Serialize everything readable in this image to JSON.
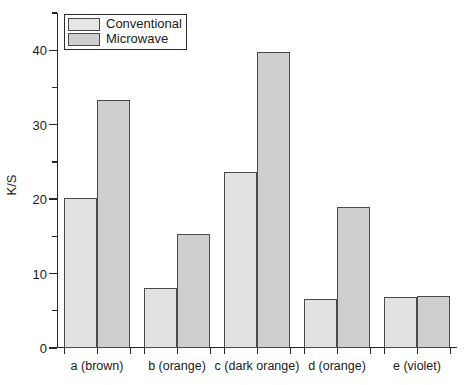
{
  "chart_data": {
    "type": "bar",
    "title": "",
    "xlabel": "",
    "ylabel": "K/S",
    "categories": [
      "a (brown)",
      "b (orange)",
      "c (dark orange)",
      "d (orange)",
      "e (violet)"
    ],
    "series": [
      {
        "name": "Conventional",
        "values": [
          20.1,
          8.1,
          23.6,
          6.6,
          6.9
        ],
        "color": "#e2e2e2"
      },
      {
        "name": "Microwave",
        "values": [
          33.3,
          15.3,
          39.7,
          18.9,
          7.0
        ],
        "color": "#cfcfcf"
      }
    ],
    "ylim": [
      0,
      45
    ],
    "y_major_ticks": [
      0,
      10,
      20,
      30,
      40
    ],
    "y_minor_ticks": [
      5,
      15,
      25,
      35,
      45
    ],
    "y_tick_labels": [
      "0",
      "10",
      "20",
      "30",
      "40"
    ],
    "grid": false,
    "legend_position": "top-left",
    "frame": "left-bottom"
  },
  "legend": {
    "entries": [
      {
        "label": "Conventional"
      },
      {
        "label": "Microwave"
      }
    ]
  },
  "axis": {
    "y_label": "K/S"
  }
}
